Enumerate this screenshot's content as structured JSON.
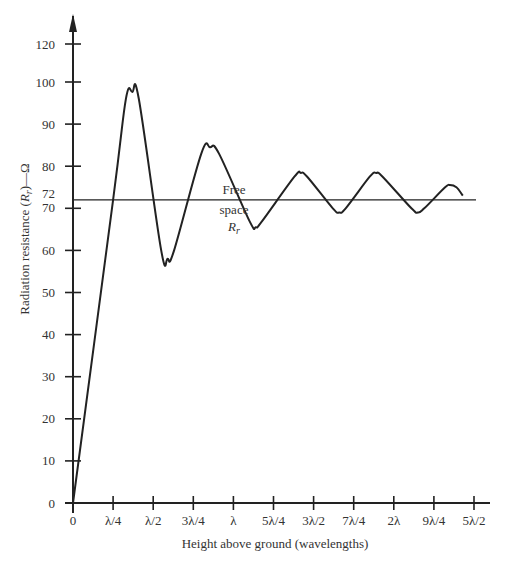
{
  "chart_data": {
    "type": "line",
    "title": "",
    "xlabel": "Height above ground (wavelengths)",
    "ylabel": "Radiation resistance (R_r)—Ω",
    "ylabel_parts": {
      "pre": "Radiation resistance (",
      "sym": "R",
      "sub": "r",
      "post": ")—Ω"
    },
    "x_ticks": [
      {
        "value": 0,
        "label": "0"
      },
      {
        "value": 0.25,
        "label": "λ/4"
      },
      {
        "value": 0.5,
        "label": "λ/2"
      },
      {
        "value": 0.75,
        "label": "3λ/4"
      },
      {
        "value": 1.0,
        "label": "λ"
      },
      {
        "value": 1.25,
        "label": "5λ/4"
      },
      {
        "value": 1.5,
        "label": "3λ/2"
      },
      {
        "value": 1.75,
        "label": "7λ/4"
      },
      {
        "value": 2.0,
        "label": "2λ"
      },
      {
        "value": 2.25,
        "label": "9λ/4"
      },
      {
        "value": 2.5,
        "label": "5λ/2"
      }
    ],
    "y_ticks": [
      0,
      10,
      20,
      30,
      40,
      50,
      60,
      70,
      72,
      80,
      90,
      100,
      120
    ],
    "xlim": [
      0,
      2.5
    ],
    "ylim": [
      0,
      120
    ],
    "grid": false,
    "legend": null,
    "series": [
      {
        "name": "Radiation resistance vs height",
        "x": [
          0,
          0.25,
          0.33,
          0.37,
          0.41,
          0.55,
          0.59,
          0.63,
          0.8,
          0.855,
          0.91,
          1.1,
          1.14,
          1.18,
          1.38,
          1.42,
          1.46,
          1.62,
          1.66,
          1.7,
          1.85,
          1.89,
          1.93,
          2.11,
          2.15,
          2.19,
          2.32,
          2.35,
          2.39,
          2.43
        ],
        "values": [
          0,
          72,
          96,
          97.6,
          96,
          60,
          58,
          60,
          83,
          84.5,
          83,
          67,
          65.5,
          67,
          77.5,
          78.4,
          77.5,
          70,
          69,
          70,
          77.5,
          78.4,
          77.5,
          70,
          69,
          70,
          75,
          75.5,
          75,
          73
        ]
      },
      {
        "name": "Free space R_r",
        "x": [
          0,
          2.5
        ],
        "values": [
          72,
          72
        ]
      }
    ],
    "annotations": [
      {
        "text": "Free",
        "x": 1.0,
        "y": 74
      },
      {
        "text": "space",
        "x": 1.0,
        "y": 69
      },
      {
        "text": "R_r",
        "x": 1.0,
        "y": 65,
        "sym": "R",
        "sub": "r"
      }
    ]
  }
}
